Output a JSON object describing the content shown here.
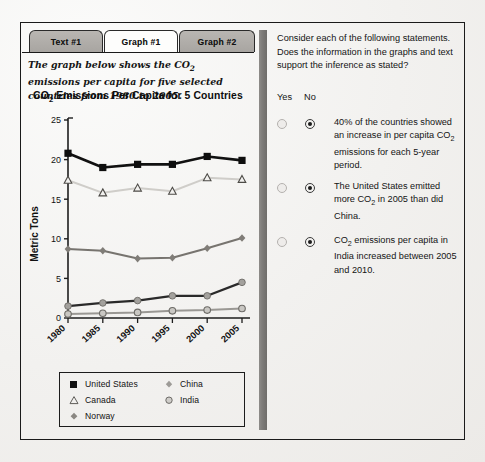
{
  "tabs": [
    {
      "label": "Text #1",
      "active": false
    },
    {
      "label": "Graph #1",
      "active": true
    },
    {
      "label": "Graph #2",
      "active": false
    }
  ],
  "intro_text": "The graph below shows the CO2 emissions per capita for five selected countries from 1980 to 2005.",
  "chart_data": {
    "type": "line",
    "title": "CO2 Emissions Per Capita for 5 Countries",
    "title_pre": "CO",
    "title_sub": "2",
    "title_post": " Emissions Per Capita for 5 Countries",
    "xlabel": "",
    "ylabel": "Metric Tons",
    "categories": [
      "1980",
      "1985",
      "1990",
      "1995",
      "2000",
      "2005"
    ],
    "x": [
      1980,
      1985,
      1990,
      1995,
      2000,
      2005
    ],
    "ylim": [
      0,
      25
    ],
    "yticks": [
      0,
      5,
      10,
      15,
      20,
      25
    ],
    "grid": false,
    "legend_position": "below",
    "series": [
      {
        "name": "United States",
        "marker": "filled-square",
        "color": "#111111",
        "values": [
          20.8,
          19.0,
          19.4,
          19.4,
          20.4,
          19.9
        ]
      },
      {
        "name": "Canada",
        "marker": "open-triangle",
        "color": "#cfcdc9",
        "values": [
          17.4,
          15.8,
          16.4,
          16.0,
          17.7,
          17.5
        ]
      },
      {
        "name": "Norway",
        "marker": "filled-diamond",
        "color": "#77746f",
        "values": [
          8.7,
          8.5,
          7.5,
          7.6,
          8.8,
          10.1
        ]
      },
      {
        "name": "China",
        "marker": "filled-circle",
        "color": "#2a2a2a",
        "values": [
          1.5,
          1.9,
          2.2,
          2.8,
          2.8,
          4.5
        ]
      },
      {
        "name": "India",
        "marker": "open-circle",
        "color": "#9a9894",
        "values": [
          0.5,
          0.6,
          0.7,
          0.9,
          1.0,
          1.2
        ]
      }
    ]
  },
  "right_panel": {
    "prompt": "Consider each of the following statements. Does the information in the graphs and text support the inference as stated?",
    "yes_label": "Yes",
    "no_label": "No",
    "statements": [
      {
        "pre": "40% of the countries showed an increase in per capita CO",
        "sub": "2",
        "post": " emissions for each 5-year period.",
        "yes_selected": false,
        "no_selected": true
      },
      {
        "pre": "The United States emitted more CO",
        "sub": "2",
        "post": " in 2005 than did China.",
        "yes_selected": false,
        "no_selected": true
      },
      {
        "pre": "CO",
        "sub": "2",
        "post": " emissions per capita in India increased between 2005 and 2010.",
        "yes_selected": false,
        "no_selected": true
      }
    ]
  },
  "colors": {
    "frame": "#1a1a1a",
    "tab_inactive": "#b0adaa",
    "tab_active": "#fdfdfc",
    "divider": "#7e7c79",
    "page_bg": "#f2f1ef"
  }
}
